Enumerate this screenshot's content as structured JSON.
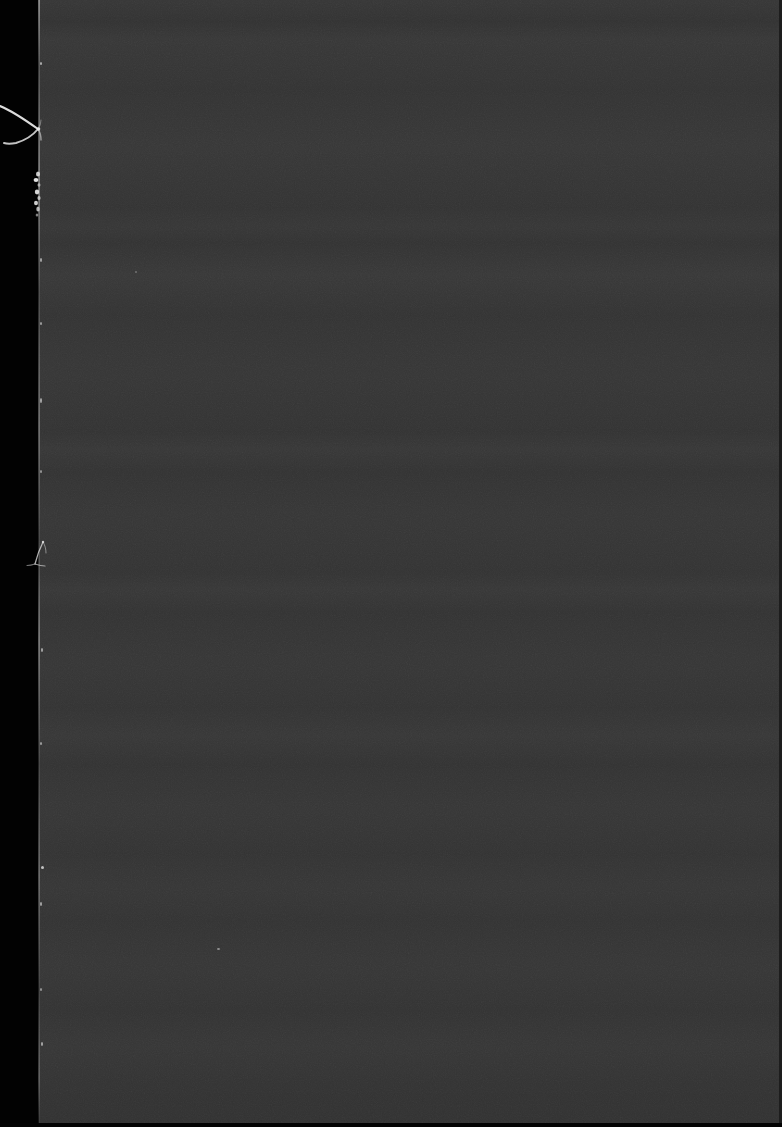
{
  "frame": {
    "width": 782,
    "height": 1127,
    "title": "Dark scanned frame",
    "description": "Near-black photographic / scanner frame: an unexposed black left margin, a large uniform dark-gray noisy field with faint horizontal banding, and bright hair-like fiber and dust artifacts clinging to the left boundary.",
    "content_text": ""
  },
  "regions": {
    "left_margin": {
      "label": "black left margin",
      "x": 0,
      "y": 0,
      "width": 39,
      "height": 1127,
      "color": "#020202"
    },
    "main_field": {
      "label": "dark gray exposed field",
      "x": 39,
      "y": 0,
      "width": 740,
      "height": 1123,
      "color": "#343434",
      "texture": "fine film grain with faint horizontal banding"
    },
    "edge_line": {
      "label": "bright boundary scan line",
      "x": 38,
      "y": 0,
      "width": 2,
      "height": 1123,
      "color": "#cfcfcf"
    },
    "right_edge": {
      "label": "dark right border strip",
      "x": 779,
      "y": 0,
      "width": 3,
      "height": 1123,
      "color": "#1d1d1d"
    },
    "bottom_edge": {
      "label": "black bottom border strip",
      "x": 0,
      "y": 1123,
      "width": 782,
      "height": 4,
      "color": "#030303"
    }
  },
  "artifacts": [
    {
      "name": "fiber-upper",
      "label": "hair-like fiber strand",
      "x": 0,
      "y": 96,
      "width": 50,
      "height": 56,
      "color": "#e6e6e6"
    },
    {
      "name": "dust-cluster-upper",
      "label": "dust speckle cluster",
      "x": 30,
      "y": 172,
      "width": 14,
      "height": 46,
      "color": "#dcdcdc"
    },
    {
      "name": "fiber-middle",
      "label": "small fiber strand",
      "x": 28,
      "y": 540,
      "width": 24,
      "height": 40,
      "color": "#c8c8c8"
    },
    {
      "name": "speck-lower-left",
      "label": "bright dust speck",
      "x": 41,
      "y": 866,
      "width": 3,
      "height": 3,
      "color": "#d6d6d6"
    },
    {
      "name": "speck-mid-field",
      "label": "bright dust speck",
      "x": 217,
      "y": 948,
      "width": 3,
      "height": 2,
      "color": "#c0c0c0"
    }
  ],
  "palette": {
    "black": "#020202",
    "field_gray": "#343434",
    "edge_highlight": "#cfcfcf",
    "right_border": "#1d1d1d"
  }
}
